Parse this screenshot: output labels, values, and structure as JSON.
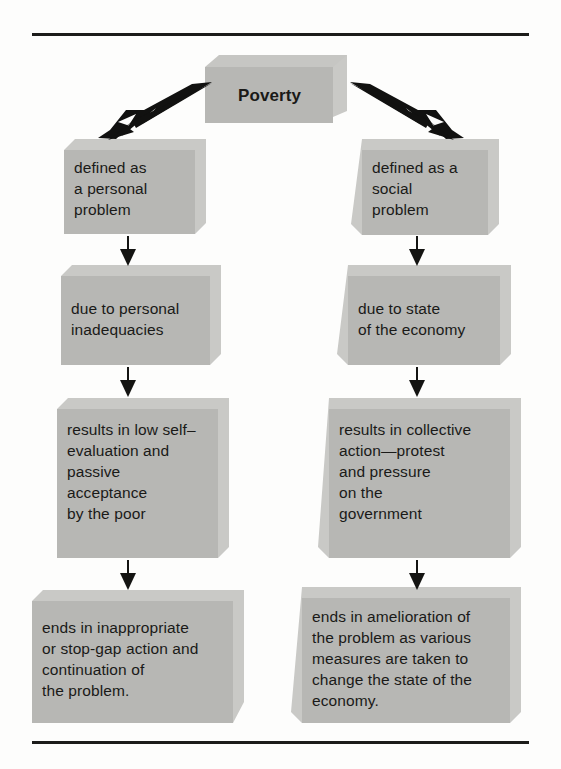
{
  "diagram": {
    "title": "Poverty",
    "root": {
      "label": "Poverty"
    },
    "branches": [
      {
        "side": "left",
        "name": "personal-problem-branch",
        "steps": [
          {
            "label": "defined as\na personal\nproblem"
          },
          {
            "label": "due to personal\ninadequacies"
          },
          {
            "label": "results in low self–\nevaluation and\npassive\nacceptance\nby the poor"
          },
          {
            "label": "ends in inappropriate\nor stop-gap action and\ncontinuation of\nthe problem."
          }
        ]
      },
      {
        "side": "right",
        "name": "social-problem-branch",
        "steps": [
          {
            "label": "defined as a\nsocial\nproblem"
          },
          {
            "label": "due to state\nof the economy"
          },
          {
            "label": "results in collective\naction—protest\nand pressure\non the\ngovernment"
          },
          {
            "label": "ends in amelioration of\nthe problem as various\nmeasures are taken to\nchange the state of the\neconomy."
          }
        ]
      }
    ],
    "connectors": [
      {
        "name": "poverty-to-left-diagonal",
        "kind": "diagonal-arrow",
        "direction": "down-left"
      },
      {
        "name": "poverty-to-right-diagonal",
        "kind": "diagonal-arrow",
        "direction": "down-right"
      },
      {
        "name": "left-arrow-1",
        "kind": "down-arrow"
      },
      {
        "name": "left-arrow-2",
        "kind": "down-arrow"
      },
      {
        "name": "left-arrow-3",
        "kind": "down-arrow"
      },
      {
        "name": "right-arrow-1",
        "kind": "down-arrow"
      },
      {
        "name": "right-arrow-2",
        "kind": "down-arrow"
      },
      {
        "name": "right-arrow-3",
        "kind": "down-arrow"
      }
    ],
    "colors": {
      "box_face": "#b7b7b4",
      "box_bevel": "#c9c9c6",
      "ink": "#1a1a18",
      "rule": "#1c1c1a",
      "page": "#fdfdfc"
    }
  }
}
